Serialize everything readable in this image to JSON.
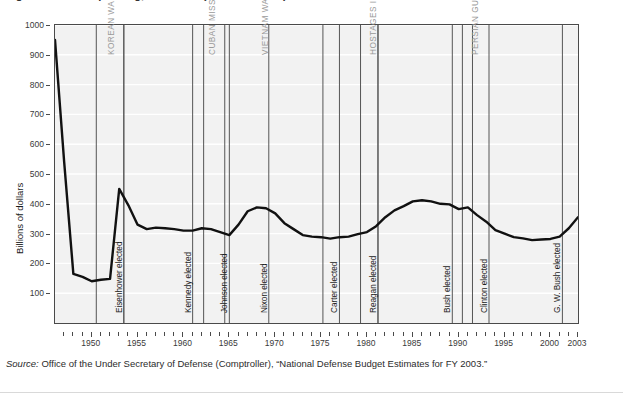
{
  "figure": {
    "title_sliver": "Figure: Defense spending, 1946-2003 (in 2003 dollars)",
    "source_prefix": "Source:",
    "source_text": " Office of the Under Secretary of Defense (Comptroller), “National Defense Budget Estimates for FY 2003.”"
  },
  "chart_data": {
    "type": "line",
    "title": "",
    "xlabel": "",
    "ylabel": "Billions of dollars",
    "xlim": [
      1946,
      2003
    ],
    "ylim": [
      0,
      1000
    ],
    "grid": true,
    "legend_position": "none",
    "ytick_labels": [
      "1000",
      "900",
      "800",
      "700",
      "600",
      "500",
      "400",
      "300",
      "200",
      "100"
    ],
    "ytick_values": [
      1000,
      900,
      800,
      700,
      600,
      500,
      400,
      300,
      200,
      100
    ],
    "xtick_labels": [
      "1950",
      "1955",
      "1960",
      "1965",
      "1970",
      "1975",
      "1980",
      "1985",
      "1990",
      "1995",
      "2000",
      "2003"
    ],
    "xtick_values": [
      1950,
      1955,
      1960,
      1965,
      1970,
      1975,
      1980,
      1985,
      1990,
      1995,
      2000,
      2003
    ],
    "series": [
      {
        "name": "National defense outlays",
        "x": [
          1946,
          1947,
          1948,
          1949,
          1950,
          1951,
          1952,
          1953,
          1954,
          1955,
          1956,
          1957,
          1958,
          1959,
          1960,
          1961,
          1962,
          1963,
          1964,
          1965,
          1966,
          1967,
          1968,
          1969,
          1970,
          1971,
          1972,
          1973,
          1974,
          1975,
          1976,
          1977,
          1978,
          1979,
          1980,
          1981,
          1982,
          1983,
          1984,
          1985,
          1986,
          1987,
          1988,
          1989,
          1990,
          1991,
          1992,
          1993,
          1994,
          1995,
          1996,
          1997,
          1998,
          1999,
          2000,
          2001,
          2002,
          2003
        ],
        "y": [
          950,
          540,
          165,
          155,
          140,
          145,
          148,
          450,
          395,
          330,
          315,
          320,
          318,
          315,
          310,
          310,
          318,
          315,
          305,
          295,
          330,
          375,
          388,
          385,
          368,
          335,
          315,
          295,
          290,
          288,
          283,
          288,
          290,
          298,
          305,
          325,
          355,
          378,
          392,
          408,
          412,
          408,
          400,
          398,
          382,
          388,
          362,
          340,
          312,
          300,
          288,
          284,
          278,
          280,
          282,
          290,
          318,
          355
        ]
      }
    ],
    "event_markers": [
      {
        "label": "KOREAN WAR",
        "start": 1950.5,
        "end": 1953.5,
        "label_x": 1951.2,
        "label_top": 30
      },
      {
        "label": "CUBAN MISSILE CRISIS",
        "start": 1962.2,
        "end": null,
        "label_x": 1962.2,
        "label_top": 30
      },
      {
        "label": "VIETNAM WAR",
        "start": 1964.5,
        "end": 1975.2,
        "label_x": 1968.0,
        "label_top": 30
      },
      {
        "label": "HOSTAGES IN IRAN",
        "start": 1979.3,
        "end": 1981.2,
        "label_x": 1979.8,
        "label_top": 30
      },
      {
        "label": "PERSIAN GULF WAR",
        "start": 1990.4,
        "end": 1991.5,
        "label_x": 1990.9,
        "label_top": 30
      }
    ],
    "election_markers": [
      {
        "label": "Eisenhower elected",
        "x": 1953.5,
        "label_bottom": 10
      },
      {
        "label": "Kennedy elected",
        "x": 1961.0,
        "label_bottom": 10
      },
      {
        "label": "Johnson elected",
        "x": 1965.0,
        "label_bottom": 10
      },
      {
        "label": "Nixon elected",
        "x": 1969.3,
        "label_bottom": 10
      },
      {
        "label": "Carter elected",
        "x": 1977.0,
        "label_bottom": 10
      },
      {
        "label": "Reagan elected",
        "x": 1981.2,
        "label_bottom": 10
      },
      {
        "label": "Bush elected",
        "x": 1989.3,
        "label_bottom": 10
      },
      {
        "label": "Clinton elected",
        "x": 1993.3,
        "label_bottom": 10
      },
      {
        "label": "G. W. Bush elected",
        "x": 2001.3,
        "label_bottom": 10
      }
    ]
  }
}
